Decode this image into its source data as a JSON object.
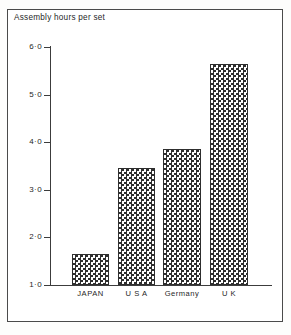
{
  "figure": {
    "title": "Assembly hours per set",
    "frame_color": "#4a4a4a",
    "background": "#ffffff",
    "bar_outline_color": "#2e2e2e",
    "bar_fill_pattern": "checkerboard"
  },
  "chart_data": {
    "type": "bar",
    "title": "Assembly hours per set",
    "xlabel": "",
    "ylabel": "Assembly hours per set",
    "categories": [
      "JAPAN",
      "U S A",
      "Germany",
      "U K"
    ],
    "values": [
      1.65,
      3.45,
      3.85,
      5.65
    ],
    "ylim": [
      1.0,
      6.0
    ],
    "yticks": [
      1.0,
      2.0,
      3.0,
      4.0,
      5.0,
      6.0
    ],
    "ytick_labels": [
      "1·0",
      "2·0",
      "3·0",
      "4·0",
      "5·0",
      "6·0"
    ],
    "grid": false,
    "legend": "none"
  },
  "axis": {
    "ticks": [
      {
        "label": "6·0",
        "value": 6.0
      },
      {
        "label": "5·0",
        "value": 5.0
      },
      {
        "label": "4·0",
        "value": 4.0
      },
      {
        "label": "3·0",
        "value": 3.0
      },
      {
        "label": "2·0",
        "value": 2.0
      },
      {
        "label": "1·0",
        "value": 1.0
      }
    ]
  },
  "bars": [
    {
      "label": "JAPAN",
      "value": 1.65
    },
    {
      "label": "U S A",
      "value": 3.45
    },
    {
      "label": "Germany",
      "value": 3.85
    },
    {
      "label": "U K",
      "value": 5.65
    }
  ]
}
